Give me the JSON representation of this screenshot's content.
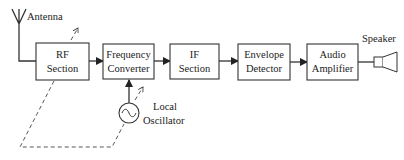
{
  "diagram": {
    "antenna_label": "Antenna",
    "speaker_label": "Speaker",
    "oscillator": {
      "line1": "Local",
      "line2": "Oscillator"
    },
    "blocks": [
      {
        "id": "rf",
        "line1": "RF",
        "line2": "Section"
      },
      {
        "id": "fc",
        "line1": "Frequency",
        "line2": "Converter"
      },
      {
        "id": "if",
        "line1": "IF",
        "line2": "Section"
      },
      {
        "id": "env",
        "line1": "Envelope",
        "line2": "Detector"
      },
      {
        "id": "aud",
        "line1": "Audio",
        "line2": "Amplifier"
      }
    ],
    "colors": {
      "stroke": "#333333",
      "background": "#ffffff"
    }
  }
}
